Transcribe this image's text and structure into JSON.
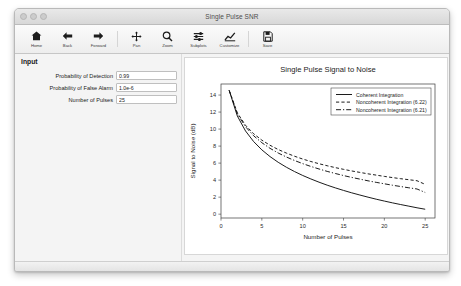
{
  "window": {
    "title": "Single Pulse SNR",
    "traffic_lights": [
      "close-button",
      "minimize-button",
      "zoom-button"
    ]
  },
  "toolbar": {
    "buttons": [
      {
        "label": "Home",
        "icon": "home-icon"
      },
      {
        "label": "Back",
        "icon": "arrow-left-icon"
      },
      {
        "label": "Forward",
        "icon": "arrow-right-icon"
      },
      {
        "label": "Pan",
        "icon": "move-cross-icon"
      },
      {
        "label": "Zoom",
        "icon": "magnifier-icon"
      },
      {
        "label": "Subplots",
        "icon": "sliders-icon"
      },
      {
        "label": "Customize",
        "icon": "line-chart-icon"
      },
      {
        "label": "Save",
        "icon": "floppy-disk-icon"
      }
    ]
  },
  "panel": {
    "title": "Input",
    "fields": [
      {
        "label": "Probability of Detection",
        "value": "0.99",
        "placeholder": ""
      },
      {
        "label": "Probability of False Alarm",
        "value": "1.0e-6",
        "placeholder": ""
      },
      {
        "label": "Number of Pulses",
        "value": "25",
        "placeholder": ""
      }
    ]
  },
  "chart_data": {
    "type": "line",
    "title": "Single Pulse Signal to Noise",
    "xlabel": "Number of Pulses",
    "ylabel": "Signal to Noise (dB)",
    "xlim": [
      0,
      26.2
    ],
    "ylim": [
      -0.45,
      15.3
    ],
    "xticks": [
      0,
      5,
      10,
      15,
      20,
      25
    ],
    "yticks": [
      0,
      2,
      4,
      6,
      8,
      10,
      12,
      14
    ],
    "grid": false,
    "legend_position": "upper right",
    "x": [
      1,
      2,
      3,
      4,
      5,
      6,
      7,
      8,
      9,
      10,
      11,
      12,
      13,
      14,
      15,
      16,
      17,
      18,
      19,
      20,
      21,
      22,
      23,
      24,
      25
    ],
    "series": [
      {
        "name": "Coherent Integration",
        "style": "solid",
        "color": "#101010",
        "values": [
          14.55,
          11.54,
          9.78,
          8.53,
          7.56,
          6.77,
          6.1,
          5.52,
          5.01,
          4.55,
          4.14,
          3.76,
          3.41,
          3.09,
          2.79,
          2.51,
          2.25,
          2.0,
          1.76,
          1.54,
          1.33,
          1.13,
          0.94,
          0.75,
          0.58
        ]
      },
      {
        "name": "Noncoherent Integration (6.22)",
        "style": "dashed",
        "color": "#101010",
        "values": [
          14.55,
          11.9,
          10.45,
          9.45,
          8.7,
          8.1,
          7.6,
          7.18,
          6.81,
          6.48,
          6.19,
          5.93,
          5.69,
          5.47,
          5.27,
          5.08,
          4.91,
          4.74,
          4.59,
          4.44,
          4.3,
          4.17,
          4.05,
          3.93,
          3.5
        ]
      },
      {
        "name": "Noncoherent Integration (6.21)",
        "style": "dashdot",
        "color": "#101010",
        "values": [
          14.55,
          11.8,
          10.28,
          9.21,
          8.4,
          7.74,
          7.19,
          6.72,
          6.31,
          5.94,
          5.61,
          5.31,
          5.03,
          4.78,
          4.54,
          4.32,
          4.12,
          3.92,
          3.74,
          3.57,
          3.4,
          3.25,
          3.1,
          2.96,
          2.55
        ]
      }
    ]
  }
}
